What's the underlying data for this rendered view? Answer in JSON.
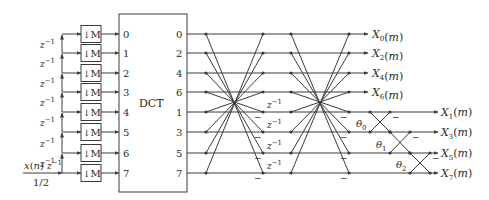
{
  "diagram": {
    "title": "",
    "colors": {
      "stroke": "#3a3a3a",
      "text": "#2a2a2a",
      "background": "#ffffff"
    },
    "rows_y": [
      34,
      53,
      73,
      92,
      112,
      132,
      153,
      173
    ],
    "input": {
      "label": "x(n)",
      "delay_label": "z⁻¹",
      "gain_label": "1/2"
    },
    "delay_chain": {
      "label": "z⁻¹",
      "count": 7
    },
    "downsamplers": {
      "label": "↓M",
      "count": 8
    },
    "dct_block": {
      "label": "DCT",
      "input_ports": [
        "0",
        "1",
        "2",
        "3",
        "4",
        "5",
        "6",
        "7"
      ],
      "output_ports": [
        "0",
        "2",
        "4",
        "6",
        "1",
        "3",
        "5",
        "7"
      ]
    },
    "butterfly_stages": [
      {
        "name": "stage-1",
        "minus_rows": [
          4,
          5,
          6,
          7
        ]
      },
      {
        "name": "stage-2",
        "minus_rows": [
          4,
          5,
          6,
          7
        ]
      }
    ],
    "inter_stage_delays": {
      "label": "z⁻¹",
      "rows": [
        4,
        5,
        6,
        7
      ]
    },
    "rotations": [
      {
        "label": "θ0",
        "sub": "0",
        "rows": [
          4,
          5
        ]
      },
      {
        "label": "θ1",
        "sub": "1",
        "rows": [
          5,
          6
        ]
      },
      {
        "label": "θ2",
        "sub": "2",
        "rows": [
          6,
          7
        ]
      }
    ],
    "minus_sign": "−",
    "outputs_even": [
      "X0(m)",
      "X2(m)",
      "X4(m)",
      "X6(m)"
    ],
    "outputs_odd": [
      "X1(m)",
      "X3(m)",
      "X5(m)",
      "X7(m)"
    ],
    "outputs_even_parts": [
      {
        "base": "X",
        "sub": "0",
        "suffix": "(m)"
      },
      {
        "base": "X",
        "sub": "2",
        "suffix": "(m)"
      },
      {
        "base": "X",
        "sub": "4",
        "suffix": "(m)"
      },
      {
        "base": "X",
        "sub": "6",
        "suffix": "(m)"
      }
    ],
    "outputs_odd_parts": [
      {
        "base": "X",
        "sub": "1",
        "suffix": "(m)"
      },
      {
        "base": "X",
        "sub": "3",
        "suffix": "(m)"
      },
      {
        "base": "X",
        "sub": "5",
        "suffix": "(m)"
      },
      {
        "base": "X",
        "sub": "7",
        "suffix": "(m)"
      }
    ]
  }
}
